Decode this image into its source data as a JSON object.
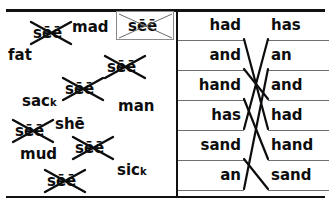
{
  "worksheet": {
    "title": "Word sort and matching worksheet",
    "colors": {
      "ink": "#0d0d0d",
      "rule": "#6f6f6f",
      "border": "#111111",
      "box": "#8a8a8a"
    }
  },
  "word_bank": {
    "label": "word-bank",
    "plain_words": [
      {
        "text": "mad",
        "x": 72,
        "y": 18
      },
      {
        "text": "fat",
        "x": 8,
        "y": 46
      },
      {
        "text": "sac",
        "sub": "k",
        "x": 22,
        "y": 92
      },
      {
        "text": "man",
        "x": 118,
        "y": 97
      },
      {
        "text": "sh",
        "macron": "ē",
        "x": 55,
        "y": 115
      },
      {
        "text": "mu",
        "italic_tail": "d",
        "x": 20,
        "y": 145
      },
      {
        "text": "sic",
        "sub": "k",
        "x": 117,
        "y": 161
      }
    ],
    "crossed_words": [
      {
        "text": "sēē",
        "x": 28,
        "y": 20
      },
      {
        "text": "sēē",
        "x": 102,
        "y": 54
      },
      {
        "text": "sēē",
        "x": 60,
        "y": 76
      },
      {
        "text": "sēē",
        "x": 10,
        "y": 118
      },
      {
        "text": "sēē",
        "x": 70,
        "y": 135
      },
      {
        "text": "sēē",
        "x": 42,
        "y": 168
      }
    ],
    "boxed_word": {
      "text": "sēē",
      "crossed": true
    }
  },
  "matching": {
    "label": "matching-exercise",
    "left_column": [
      "had",
      "and",
      "hand",
      "has",
      "sand",
      "an"
    ],
    "right_column": [
      "has",
      "an",
      "and",
      "had",
      "hand",
      "sand"
    ],
    "connections": [
      {
        "from": 0,
        "to": 3
      },
      {
        "from": 1,
        "to": 2
      },
      {
        "from": 2,
        "to": 4
      },
      {
        "from": 3,
        "to": 0
      },
      {
        "from": 4,
        "to": 5
      },
      {
        "from": 5,
        "to": 1
      }
    ]
  }
}
